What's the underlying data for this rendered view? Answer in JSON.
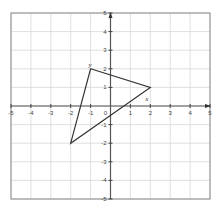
{
  "diagram": {
    "type": "coordinate-plane",
    "x_range": [
      -5,
      5
    ],
    "y_range": [
      -5,
      5
    ],
    "x_ticks": [
      "-5",
      "-4",
      "-3",
      "-2",
      "-1",
      "0",
      "1",
      "2",
      "3",
      "4",
      "5"
    ],
    "y_ticks": [
      "5",
      "4",
      "3",
      "2",
      "1",
      "-1",
      "-2",
      "-3",
      "-4",
      "-5"
    ],
    "grid": true,
    "shape": {
      "type": "triangle",
      "vertices": [
        [
          -1,
          2
        ],
        [
          2,
          1
        ],
        [
          -2,
          -2
        ]
      ]
    },
    "labels": {
      "y": "y",
      "x": "x"
    },
    "colors": {
      "grid": "#d8d8d8",
      "border": "#8a8a8a",
      "axis": "#555555",
      "shape": "#333333"
    }
  },
  "chart_data": {
    "type": "scatter",
    "title": "",
    "xlabel": "x",
    "ylabel": "y",
    "xlim": [
      -5,
      5
    ],
    "ylim": [
      -5,
      5
    ],
    "grid": true,
    "series": [
      {
        "name": "triangle",
        "x": [
          -1,
          2,
          -2,
          -1
        ],
        "y": [
          2,
          1,
          -2,
          2
        ]
      }
    ]
  }
}
